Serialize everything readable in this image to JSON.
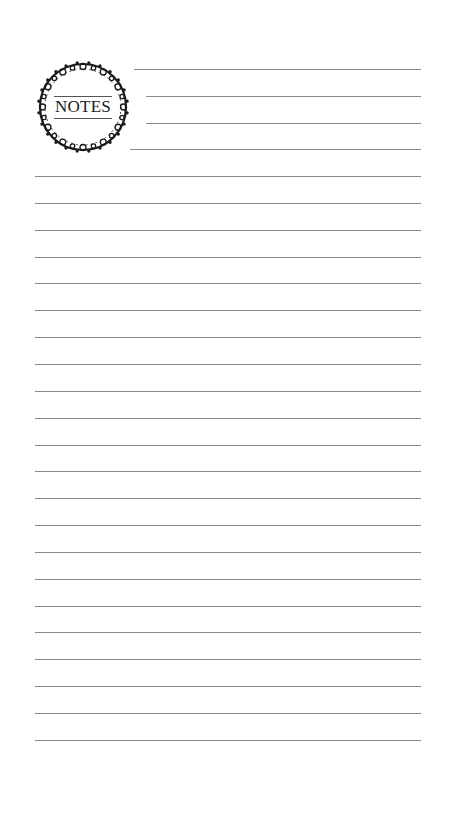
{
  "page": {
    "type": "lined notes page",
    "background": "#ffffff",
    "line_color": "#8a8a8a",
    "ornament_color": "#1a1a1a"
  },
  "header": {
    "title": "NOTES",
    "ornament": "floral-wreath-frame"
  },
  "lines": {
    "short": [
      {
        "y": 69,
        "x1": 134,
        "x2": 421
      },
      {
        "y": 96,
        "x1": 146,
        "x2": 421
      },
      {
        "y": 123,
        "x1": 146,
        "x2": 421
      },
      {
        "y": 149,
        "x1": 130,
        "x2": 421
      }
    ],
    "full": {
      "start_y": 176,
      "spacing": 26.85,
      "count": 22,
      "x1": 35,
      "x2": 421
    }
  }
}
